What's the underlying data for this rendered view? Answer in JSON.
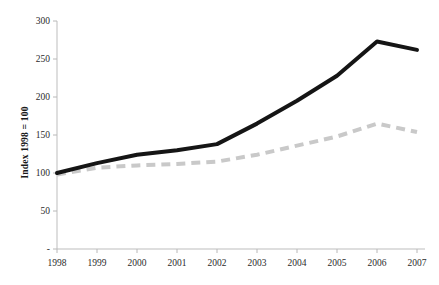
{
  "chart_data": {
    "type": "line",
    "title": "",
    "xlabel": "",
    "ylabel": "Index 1998 = 100",
    "categories": [
      "1998",
      "1999",
      "2000",
      "2001",
      "2002",
      "2003",
      "2004",
      "2005",
      "2006",
      "2007"
    ],
    "x": [
      1998,
      1999,
      2000,
      2001,
      2002,
      2003,
      2004,
      2005,
      2006,
      2007
    ],
    "xlim": [
      1998,
      2007
    ],
    "ylim": [
      0,
      300
    ],
    "yticks": [
      0,
      50,
      100,
      150,
      200,
      250,
      300
    ],
    "ytick_labels": [
      "-",
      "50",
      "100",
      "150",
      "200",
      "250",
      "300"
    ],
    "grid": false,
    "legend": "none",
    "series": [
      {
        "name": "solid-black-series",
        "style": "solid",
        "color": "#151515",
        "width": 4,
        "values": [
          100,
          113,
          124,
          130,
          138,
          165,
          195,
          228,
          273,
          262
        ]
      },
      {
        "name": "dashed-gray-series",
        "style": "dashed",
        "color": "#c9c9c9",
        "width": 4,
        "values": [
          98,
          107,
          110,
          112,
          115,
          124,
          136,
          148,
          165,
          154
        ]
      }
    ]
  },
  "axes": {
    "y_axis_title": "Index 1998 = 100",
    "y_tick_0": "-",
    "y_tick_50": "50",
    "y_tick_100": "100",
    "y_tick_150": "150",
    "y_tick_200": "200",
    "y_tick_250": "250",
    "y_tick_300": "300",
    "x_tick_1998": "1998",
    "x_tick_1999": "1999",
    "x_tick_2000": "2000",
    "x_tick_2001": "2001",
    "x_tick_2002": "2002",
    "x_tick_2003": "2003",
    "x_tick_2004": "2004",
    "x_tick_2005": "2005",
    "x_tick_2006": "2006",
    "x_tick_2007": "2007"
  },
  "colors": {
    "axis": "#b8b8b8",
    "series_primary": "#151515",
    "series_secondary": "#c9c9c9",
    "text": "#2b2b2b",
    "background": "#ffffff"
  }
}
